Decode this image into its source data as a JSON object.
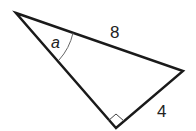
{
  "diagram": {
    "type": "right-triangle",
    "vertices": {
      "top_left": [
        16,
        13
      ],
      "right": [
        183,
        71
      ],
      "bottom_right_angle": [
        116,
        128
      ]
    },
    "labels": {
      "hypotenuse": "8",
      "angle": "a",
      "short_leg": "4"
    },
    "colors": {
      "stroke": "#1a1a1a",
      "arc": "#666666",
      "background": "#ffffff"
    }
  }
}
